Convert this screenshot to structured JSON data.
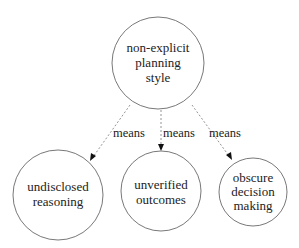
{
  "diagram": {
    "root": {
      "lines": [
        "non-explicit",
        "planning",
        "style"
      ]
    },
    "children": [
      {
        "lines": [
          "undisclosed",
          "reasoning"
        ],
        "edge_label": "means"
      },
      {
        "lines": [
          "unverified",
          "outcomes"
        ],
        "edge_label": "means"
      },
      {
        "lines": [
          "obscure",
          "decision",
          "making"
        ],
        "edge_label": "means"
      }
    ],
    "colors": {
      "node_stroke": "#555555",
      "edge": "#888888",
      "text": "#222222"
    }
  }
}
